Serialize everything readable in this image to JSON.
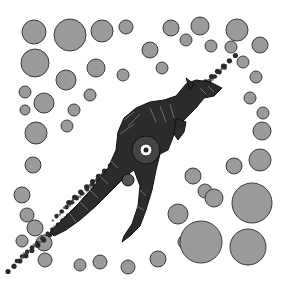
{
  "artwork": {
    "subject": "kangaroo",
    "style": "aboriginal dot painting",
    "palette": {
      "background": "#ffffff",
      "large_dots": "#9a9a9a",
      "large_dot_outline": "#3a3a3a",
      "small_dots": "#2a2a2a",
      "kangaroo_body": "#2b2b2b",
      "pattern_lines": "#9a9a9a"
    },
    "large_dots": [
      [
        34,
        32,
        12
      ],
      [
        70,
        35,
        16
      ],
      [
        102,
        31,
        11
      ],
      [
        126,
        27,
        7
      ],
      [
        171,
        28,
        8
      ],
      [
        200,
        26,
        9
      ],
      [
        237,
        30,
        11
      ],
      [
        35,
        63,
        14
      ],
      [
        96,
        68,
        9
      ],
      [
        150,
        50,
        8
      ],
      [
        186,
        40,
        6
      ],
      [
        211,
        46,
        6
      ],
      [
        231,
        47,
        6
      ],
      [
        260,
        45,
        8
      ],
      [
        66,
        80,
        10
      ],
      [
        123,
        75,
        6
      ],
      [
        162,
        68,
        6
      ],
      [
        243,
        62,
        6
      ],
      [
        256,
        77,
        6
      ],
      [
        25,
        92,
        6
      ],
      [
        44,
        103,
        10
      ],
      [
        90,
        95,
        6
      ],
      [
        250,
        98,
        6
      ],
      [
        263,
        113,
        6
      ],
      [
        25,
        110,
        5
      ],
      [
        36,
        133,
        11
      ],
      [
        74,
        110,
        6
      ],
      [
        262,
        131,
        9
      ],
      [
        67,
        126,
        6
      ],
      [
        260,
        160,
        11
      ],
      [
        234,
        166,
        8
      ],
      [
        252,
        203,
        20
      ],
      [
        33,
        165,
        8
      ],
      [
        22,
        195,
        8
      ],
      [
        27,
        215,
        7
      ],
      [
        35,
        228,
        8
      ],
      [
        44,
        243,
        8
      ],
      [
        22,
        241,
        6
      ],
      [
        45,
        260,
        7
      ],
      [
        80,
        265,
        6
      ],
      [
        100,
        262,
        7
      ],
      [
        128,
        267,
        7
      ],
      [
        158,
        259,
        8
      ],
      [
        185,
        242,
        7
      ],
      [
        193,
        176,
        8
      ],
      [
        205,
        191,
        7
      ],
      [
        201,
        242,
        21
      ],
      [
        248,
        247,
        18
      ],
      [
        178,
        214,
        10
      ],
      [
        214,
        198,
        9
      ]
    ]
  }
}
